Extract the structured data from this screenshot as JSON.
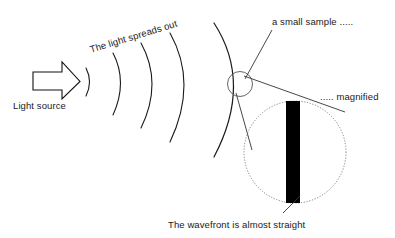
{
  "diagram": {
    "labels": {
      "light_source": "Light source",
      "spreads_out": "The light spreads out",
      "small_sample": "a small sample .....",
      "magnified": "..... magnified",
      "wavefront": "The wavefront is almost straight"
    },
    "colors": {
      "stroke": "#111111",
      "wave_stroke": "#1a1a1a",
      "bar_fill": "#000000",
      "background": "#ffffff",
      "circle_stroke": "#555555",
      "leader_stroke": "#333333"
    },
    "icons": {
      "light_source": "horn-emitter-icon",
      "sample_circle": "small-sample-circle-icon",
      "magnifier_circle": "magnified-view-circle-icon",
      "wavefront_bar": "straight-wavefront-bar-icon"
    },
    "wavefronts": {
      "count": 5,
      "description": "Concentric arcs of increasing radius emanating rightward from the light source"
    }
  }
}
